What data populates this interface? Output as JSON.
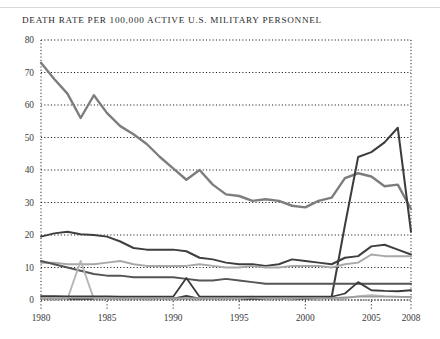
{
  "page": {
    "background": "#ffffff"
  },
  "header": {
    "title": "DEATH RATE PER 100,000 ACTIVE U.S. MILITARY PERSONNEL"
  },
  "chart_data": {
    "type": "line",
    "title": "DEATH RATE PER 100,000 ACTIVE U.S. MILITARY PERSONNEL",
    "xlabel": "",
    "ylabel": "",
    "xlim": [
      1980,
      2008
    ],
    "ylim": [
      0,
      80
    ],
    "grid": true,
    "grid_style": "dotted",
    "legend": "none",
    "yticks": [
      0,
      10,
      20,
      30,
      40,
      50,
      60,
      70,
      80
    ],
    "ytick_labels": [
      "0",
      "10",
      "20",
      "30",
      "40",
      "50",
      "60",
      "70",
      "80"
    ],
    "xticks": [
      1980,
      1985,
      1990,
      1995,
      2000,
      2005,
      2008
    ],
    "xtick_labels": [
      "1980",
      "1985",
      "1990",
      "1995",
      "2000",
      "2005",
      "2008"
    ],
    "x": [
      1980,
      1981,
      1982,
      1983,
      1984,
      1985,
      1986,
      1987,
      1988,
      1989,
      1990,
      1991,
      1992,
      1993,
      1994,
      1995,
      1996,
      1997,
      1998,
      1999,
      2000,
      2001,
      2002,
      2003,
      2004,
      2005,
      2006,
      2007,
      2008
    ],
    "series": [
      {
        "name": "total-death-rate",
        "color": "#7d7d7d",
        "width": 2.4,
        "values": [
          73.0,
          68.0,
          63.5,
          56.0,
          63.0,
          57.5,
          53.5,
          51.0,
          48.0,
          44.0,
          40.5,
          37.0,
          40.0,
          35.5,
          32.5,
          32.0,
          30.5,
          31.0,
          30.5,
          29.0,
          28.5,
          30.5,
          31.5,
          37.5,
          39.0,
          38.0,
          35.0,
          35.5,
          28.0
        ]
      },
      {
        "name": "hostile-action-deaths",
        "color": "#3c3c3c",
        "width": 2.0,
        "values": [
          0.4,
          0.4,
          0.4,
          0.4,
          0.4,
          0.4,
          0.4,
          0.4,
          0.4,
          0.4,
          0.4,
          1.2,
          0.4,
          0.4,
          0.4,
          0.4,
          0.4,
          0.4,
          0.4,
          0.4,
          0.5,
          0.6,
          1.0,
          23.0,
          44.0,
          45.5,
          48.5,
          53.0,
          21.0
        ]
      },
      {
        "name": "accident-deaths",
        "color": "#3f3f3f",
        "width": 2.0,
        "values": [
          19.5,
          20.5,
          21.0,
          20.2,
          20.0,
          19.5,
          18.0,
          16.0,
          15.5,
          15.5,
          15.5,
          15.0,
          13.0,
          12.5,
          11.5,
          11.0,
          11.0,
          10.5,
          11.0,
          12.5,
          12.0,
          11.5,
          11.0,
          13.0,
          13.5,
          16.5,
          17.0,
          15.5,
          14.0
        ]
      },
      {
        "name": "illness-deaths",
        "color": "#a8a8a8",
        "width": 2.0,
        "values": [
          11.5,
          11.5,
          11.0,
          11.0,
          11.0,
          11.5,
          12.0,
          11.0,
          10.5,
          10.5,
          10.5,
          10.5,
          11.0,
          10.5,
          10.0,
          10.0,
          10.5,
          10.0,
          10.0,
          10.5,
          10.5,
          10.5,
          10.0,
          11.0,
          11.5,
          14.0,
          13.5,
          13.5,
          13.5
        ]
      },
      {
        "name": "self-inflicted-deaths",
        "color": "#555555",
        "width": 2.0,
        "values": [
          12.0,
          11.0,
          10.0,
          9.0,
          8.0,
          7.5,
          7.5,
          7.0,
          7.0,
          7.0,
          7.0,
          6.5,
          6.0,
          6.0,
          6.5,
          6.0,
          5.5,
          5.0,
          5.0,
          5.0,
          5.0,
          5.0,
          5.0,
          5.0,
          5.0,
          5.0,
          5.0,
          5.0,
          5.0
        ]
      },
      {
        "name": "terrorist-event-deaths",
        "color": "#b5b5b5",
        "width": 1.9,
        "values": [
          0.3,
          0.3,
          0.3,
          12.0,
          0.3,
          0.3,
          0.3,
          0.3,
          0.3,
          0.3,
          0.3,
          0.3,
          0.3,
          0.3,
          0.3,
          0.3,
          1.0,
          0.3,
          0.3,
          0.3,
          0.8,
          0.6,
          0.4,
          0.5,
          1.2,
          1.5,
          1.2,
          1.0,
          0.8
        ]
      },
      {
        "name": "homicide-deaths",
        "color": "#3a3a3a",
        "width": 1.8,
        "values": [
          1.2,
          1.2,
          1.1,
          1.1,
          1.1,
          1.1,
          1.0,
          1.0,
          1.0,
          1.0,
          1.0,
          6.8,
          1.0,
          1.0,
          1.0,
          1.0,
          1.0,
          1.0,
          1.0,
          1.0,
          1.0,
          1.0,
          1.0,
          2.0,
          5.5,
          3.0,
          2.8,
          2.7,
          3.0
        ]
      },
      {
        "name": "undetermined-deaths",
        "color": "#9a9a9a",
        "width": 1.6,
        "values": [
          0.6,
          0.6,
          0.6,
          0.6,
          0.6,
          0.6,
          0.6,
          0.6,
          0.6,
          0.6,
          0.6,
          0.6,
          0.6,
          0.6,
          0.6,
          0.6,
          0.6,
          0.6,
          0.6,
          0.6,
          0.6,
          0.6,
          0.6,
          0.8,
          1.0,
          1.0,
          1.0,
          1.0,
          1.0
        ]
      }
    ]
  }
}
